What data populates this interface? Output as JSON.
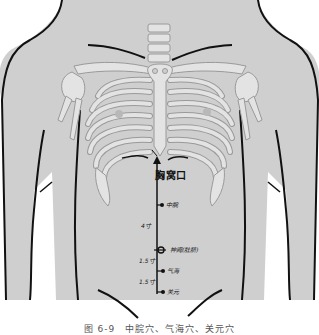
{
  "figure": {
    "caption": "图 6-9　中脘穴、气海穴、关元穴",
    "colors": {
      "skin": "#cfcfcf",
      "bone": "#e3e3e3",
      "bone_outline": "#9a9a9a",
      "body_outline": "#111111",
      "background": "#ffffff",
      "marker": "#111111"
    }
  },
  "landmarks": {
    "xiphoid": {
      "label": "胸窝口"
    }
  },
  "acupoints": [
    {
      "name": "中脘",
      "label": "中脘"
    },
    {
      "name": "神阙",
      "label": "神阙(肚脐)"
    },
    {
      "name": "气海",
      "label": "气海"
    },
    {
      "name": "关元",
      "label": "关元"
    }
  ],
  "distances": [
    {
      "label": "4寸",
      "between": "中脘-神阙"
    },
    {
      "label": "1.5寸",
      "between": "神阙-气海"
    },
    {
      "label": "1.5寸",
      "between": "气海-关元"
    }
  ]
}
